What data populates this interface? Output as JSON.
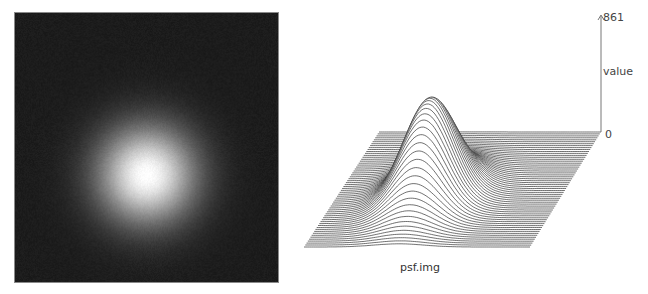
{
  "chart_data": {
    "type": "surface",
    "title": "psf.img",
    "panels": [
      {
        "name": "psf-intensity-image",
        "type": "heatmap",
        "description": "Grayscale image of a 2D Gaussian point spread function, bright center on dark background",
        "colormap": "gray",
        "center": [
          0.5,
          0.6
        ],
        "sigma_fraction": 0.13
      },
      {
        "name": "psf-3d-wireframe",
        "type": "surface",
        "zlabel": "value",
        "zlim": [
          0,
          861
        ],
        "ticks": [
          "861",
          "0"
        ],
        "peak_value": 861,
        "shape": "2D Gaussian",
        "xlabel": "psf.img"
      }
    ]
  },
  "labels": {
    "max_value": "861",
    "axis_name": "value",
    "min_value": "0",
    "filename": "psf.img"
  },
  "colors": {
    "background": "#ffffff",
    "image_bg": "#1c1c1c",
    "line": "#333333",
    "axis": "#777777"
  }
}
